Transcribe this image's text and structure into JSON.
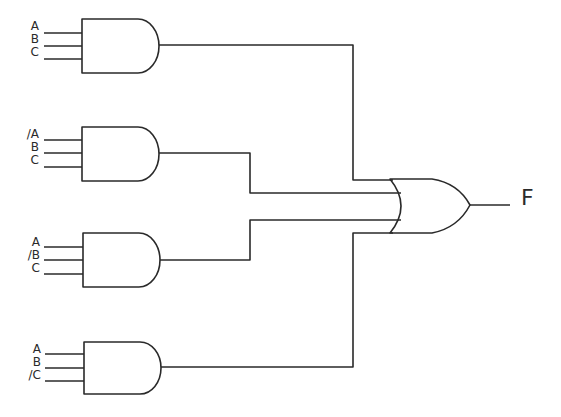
{
  "diagram": {
    "stroke_color": "#2a2a2a",
    "background": "#ffffff",
    "and_gates": [
      {
        "id": "and1",
        "inputs": [
          "A",
          "B",
          "C"
        ]
      },
      {
        "id": "and2",
        "inputs": [
          "/A",
          "B",
          "C"
        ]
      },
      {
        "id": "and3",
        "inputs": [
          "A",
          "/B",
          "C"
        ]
      },
      {
        "id": "and4",
        "inputs": [
          "A",
          "B",
          "/C"
        ]
      }
    ],
    "or_gate": {
      "id": "or1",
      "inputs": 4
    },
    "output": {
      "label": "F"
    }
  }
}
